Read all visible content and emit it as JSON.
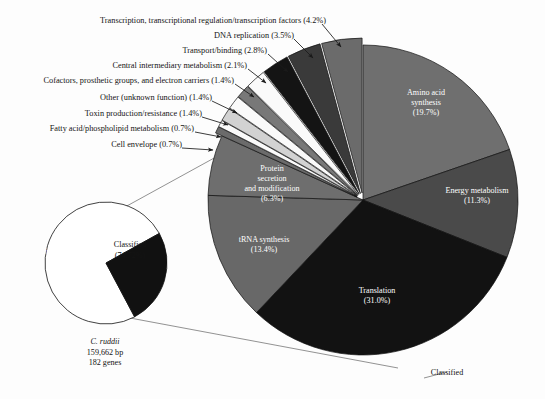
{
  "figure": {
    "background": "#fdfdfd",
    "label_color": "#141414",
    "white_text": "#ffffff",
    "outline": "#111111"
  },
  "chart_data": {
    "type": "pie",
    "title": "",
    "legend_position": "callouts",
    "grid": false,
    "main_pie": {
      "name": "Classified gene functions",
      "bottom_label": "Classified",
      "total_percent": 100.0,
      "start_angle_deg": 0,
      "direction": "clockwise",
      "categories": [
        "Amino acid synthesis",
        "Energy metabolism",
        "Translation",
        "tRNA synthesis",
        "Protein secretion and modification",
        "Cell envelope",
        "Fatty acid/phospholipid metabolism",
        "Toxin production/resistance",
        "Other (unknown function)",
        "Cofactors, prosthetic groups, and electron carriers",
        "Central intermediary metabolism",
        "Transport/binding",
        "DNA replication",
        "Transcription, transcriptional regulation/transcription factors"
      ],
      "values": [
        19.7,
        11.3,
        31.0,
        13.4,
        6.3,
        0.7,
        0.7,
        1.4,
        1.4,
        1.4,
        2.1,
        2.8,
        3.5,
        4.2
      ],
      "slices": [
        {
          "label": "Amino acid synthesis",
          "value": 19.7,
          "percent_text": "(19.7%)",
          "color": "#6f6f6f",
          "inside_label": true,
          "text_color": "#ffffff",
          "exploded": false
        },
        {
          "label": "Energy metabolism",
          "value": 11.3,
          "percent_text": "(11.3%)",
          "color": "#4a4a4a",
          "inside_label": true,
          "text_color": "#ffffff",
          "exploded": false
        },
        {
          "label": "Translation",
          "value": 31.0,
          "percent_text": "(31.0%)",
          "color": "#121212",
          "inside_label": true,
          "text_color": "#ffffff",
          "exploded": false
        },
        {
          "label": "tRNA synthesis",
          "value": 13.4,
          "percent_text": "(13.4%)",
          "color": "#686868",
          "inside_label": true,
          "text_color": "#ffffff",
          "exploded": false
        },
        {
          "label": "Protein secretion and modification",
          "value": 6.3,
          "percent_text": "(6.3%)",
          "color": "#6e6e6e",
          "inside_label": true,
          "text_color": "#ffffff",
          "exploded": false
        },
        {
          "label": "Cell envelope",
          "value": 0.7,
          "percent_text": "(0.7%)",
          "color": "#6b6b6b",
          "inside_label": false,
          "text_color": "#141414",
          "exploded": true
        },
        {
          "label": "Fatty acid/phospholipid metabolism",
          "value": 0.7,
          "percent_text": "(0.7%)",
          "color": "#fafafa",
          "inside_label": false,
          "text_color": "#141414",
          "exploded": true
        },
        {
          "label": "Toxin production/resistance",
          "value": 1.4,
          "percent_text": "(1.4%)",
          "color": "#d2d2d2",
          "inside_label": false,
          "text_color": "#141414",
          "exploded": true
        },
        {
          "label": "Other (unknown function)",
          "value": 1.4,
          "percent_text": "(1.4%)",
          "color": "#fafafa",
          "inside_label": false,
          "text_color": "#141414",
          "exploded": true
        },
        {
          "label": "Cofactors, prosthetic groups, and electron carriers",
          "value": 1.4,
          "percent_text": "(1.4%)",
          "color": "#787878",
          "inside_label": false,
          "text_color": "#141414",
          "exploded": true
        },
        {
          "label": "Central intermediary metabolism",
          "value": 2.1,
          "percent_text": "(2.1%)",
          "color": "#fafafa",
          "inside_label": false,
          "text_color": "#141414",
          "exploded": true
        },
        {
          "label": "Transport/binding",
          "value": 2.8,
          "percent_text": "(2.8%)",
          "color": "#141414",
          "inside_label": false,
          "text_color": "#141414",
          "exploded": true
        },
        {
          "label": "DNA replication",
          "value": 3.5,
          "percent_text": "(3.5%)",
          "color": "#3a3a3a",
          "inside_label": false,
          "text_color": "#141414",
          "exploded": true
        },
        {
          "label": "Transcription, transcriptional regulation/transcription factors",
          "value": 4.2,
          "percent_text": "(4.2%)",
          "color": "#6b6b6b",
          "inside_label": false,
          "text_color": "#141414",
          "exploded": true
        }
      ]
    },
    "inset_pie": {
      "name": "Genome classification",
      "categories": [
        "Classified",
        "Unclassified"
      ],
      "values": [
        74.72,
        25.28
      ],
      "slices": [
        {
          "label": "Classified",
          "percent_text": "(74.72%)",
          "value": 74.72,
          "color": "#ffffff",
          "text_color": "#141414"
        },
        {
          "label": "Unclassified",
          "percent_text": "",
          "value": 25.28,
          "color": "#111111",
          "text_color": "#ffffff"
        }
      ],
      "caption": {
        "species": "C. ruddii",
        "genome_size": "159,662 bp",
        "gene_count": "182 genes"
      }
    }
  },
  "callouts": [
    {
      "id": "transcription",
      "text": "Transcription, transcriptional regulation/transcription factors (4.2%)"
    },
    {
      "id": "dna-replication",
      "text": "DNA replication (3.5%)"
    },
    {
      "id": "transport-binding",
      "text": "Transport/binding (2.8%)"
    },
    {
      "id": "central-intermediary",
      "text": "Central intermediary metabolism (2.1%)"
    },
    {
      "id": "cofactors",
      "text": "Cofactors, prosthetic groups, and electron carriers (1.4%)"
    },
    {
      "id": "other-unknown",
      "text": "Other (unknown function) (1.4%)"
    },
    {
      "id": "toxin",
      "text": "Toxin production/resistance (1.4%)"
    },
    {
      "id": "fatty-acid",
      "text": "Fatty acid/phospholipid metabolism (0.7%)"
    },
    {
      "id": "cell-envelope",
      "text": "Cell envelope (0.7%)"
    }
  ],
  "inner_labels": {
    "amino_acid_l1": "Amino acid",
    "amino_acid_l2": "synthesis",
    "amino_acid_l3": "(19.7%)",
    "energy_l1": "Energy metabolism",
    "energy_l2": "(11.3%)",
    "translation_l1": "Translation",
    "translation_l2": "(31.0%)",
    "trna_l1": "tRNA synthesis",
    "trna_l2": "(13.4%)",
    "protein_l1": "Protein",
    "protein_l2": "secretion",
    "protein_l3": "and modification",
    "protein_l4": "(6.3%)",
    "classified_bottom": "Classified"
  },
  "inset_labels": {
    "classified_l1": "Classified",
    "classified_l2": "(74.72%)",
    "unclassified": "Unclassified",
    "caption_species": "C. ruddii",
    "caption_size": "159,662 bp",
    "caption_genes": "182 genes"
  }
}
